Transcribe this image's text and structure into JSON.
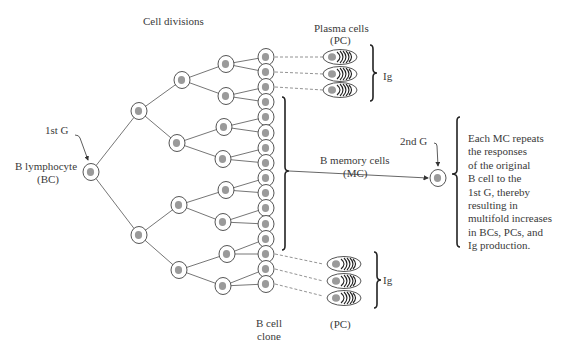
{
  "labels": {
    "cell_divisions": "Cell divisions",
    "plasma_cells": "Plasma cells",
    "plasma_cells_abbr": "(PC)",
    "ig_top": "Ig",
    "ig_bottom": "Ig",
    "first_g": "1st G",
    "b_lymphocyte": "B lymphocyte",
    "b_lymphocyte_abbr": "(BC)",
    "b_memory_cells": "B memory cells",
    "b_memory_cells_abbr": "(MC)",
    "second_g": "2nd G",
    "b_cell_clone_1": "B cell",
    "b_cell_clone_2": "clone",
    "pc_bottom": "(PC)"
  },
  "description": {
    "lines": [
      "Each MC repeats",
      "the responses",
      "of the original",
      "B cell to the",
      "1st G, thereby",
      "resulting in",
      "multifold increases",
      "in BCs, PCs, and",
      "Ig production."
    ]
  },
  "colors": {
    "line": "#555555",
    "nucleus": "#9a9a9a",
    "bracket": "#222222"
  }
}
